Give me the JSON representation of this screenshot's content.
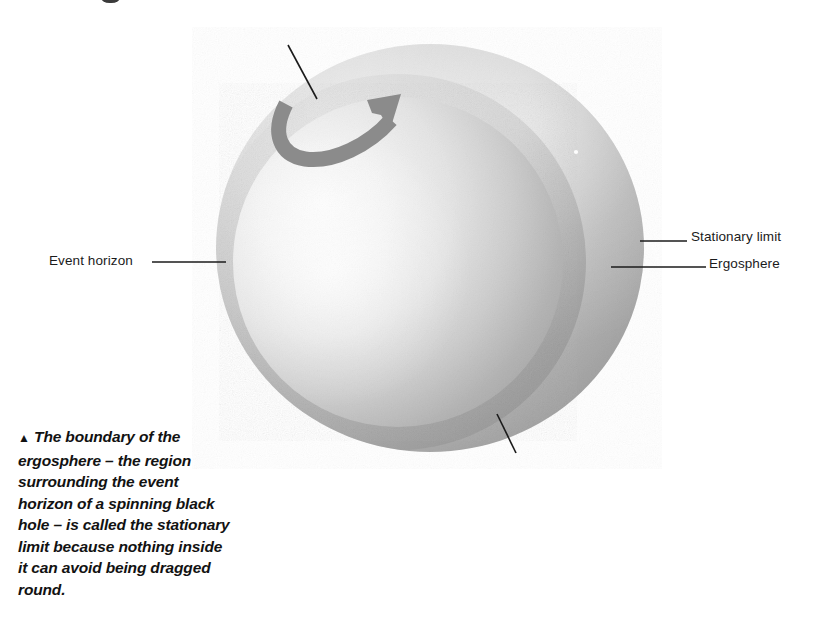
{
  "figure": {
    "kind": "astronomy-illustration",
    "background_color": "#ffffff",
    "ergosphere": {
      "name": "ergosphere",
      "shape": "oblate-ellipsoid",
      "fill_light": "#e9e9e9",
      "fill_mid": "#bdbdbd",
      "fill_dark": "#9a9a9a",
      "center_x": 430,
      "center_y": 248,
      "radius_x": 214,
      "radius_y": 204
    },
    "event_horizon": {
      "name": "event horizon",
      "shape": "sphere",
      "fill_light": "#fbfbfb",
      "fill_mid": "#d7d7d7",
      "fill_dark": "#a9a9a9",
      "center_x": 398,
      "center_y": 262,
      "radius": 165
    },
    "spin_arrow": {
      "name": "rotation-arrow",
      "description": "curved U-shaped arrow indicating the direction of spin",
      "color": "#8b8b8b",
      "direction": "counter-clockwise-sweeping-up-right"
    },
    "leader_lines": {
      "color": "#1b1b1b",
      "width": 1.3
    }
  },
  "labels": {
    "event_horizon": "Event horizon",
    "stationary_limit": "Stationary limit",
    "ergosphere": "Ergosphere"
  },
  "caption": {
    "marker": "▲",
    "text": "The boundary of the ergosphere – the region surrounding the event horizon of a spinning black hole – is called the stationary limit because nothing inside it can avoid being dragged round."
  }
}
